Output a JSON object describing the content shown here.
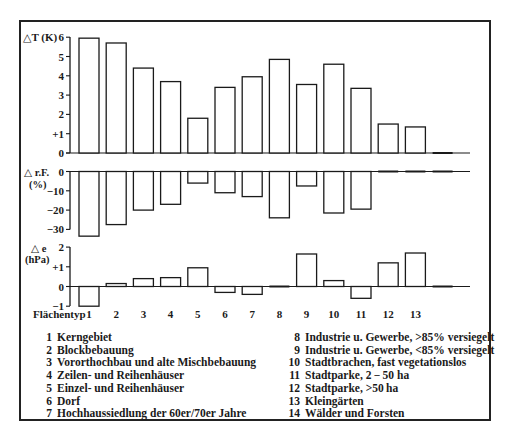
{
  "chart_data": [
    {
      "type": "bar",
      "title": "",
      "ylabel": "△T (K)",
      "xlabel": "Flächentyp",
      "categories": [
        "1",
        "2",
        "3",
        "4",
        "5",
        "6",
        "7",
        "8",
        "9",
        "10",
        "11",
        "12",
        "13",
        "14"
      ],
      "values": [
        5.95,
        5.7,
        4.4,
        3.7,
        1.8,
        3.4,
        3.95,
        4.85,
        3.55,
        4.6,
        3.35,
        1.5,
        1.35,
        0.05
      ],
      "ylim": [
        0,
        6
      ],
      "yticks": [
        "0",
        "+1",
        "2",
        "3",
        "4",
        "5",
        "6"
      ],
      "grid": false
    },
    {
      "type": "bar",
      "title": "",
      "ylabel": "△r.F. (%)",
      "xlabel": "Flächentyp",
      "categories": [
        "1",
        "2",
        "3",
        "4",
        "5",
        "6",
        "7",
        "8",
        "9",
        "10",
        "11",
        "12",
        "13",
        "14"
      ],
      "values": [
        -33.5,
        -27.5,
        -20,
        -17,
        -6,
        -11,
        -13,
        -24,
        -7.5,
        -21.5,
        -19.5,
        -0.5,
        -0.5,
        -0.3
      ],
      "ylim": [
        -35,
        0
      ],
      "yticks": [
        "0",
        "−10",
        "−20",
        "−30"
      ],
      "grid": false
    },
    {
      "type": "bar",
      "title": "",
      "ylabel": "△e (hPa)",
      "xlabel": "Flächentyp",
      "categories": [
        "1",
        "2",
        "3",
        "4",
        "5",
        "6",
        "7",
        "8",
        "9",
        "10",
        "11",
        "12",
        "13",
        "14"
      ],
      "values": [
        -1.0,
        0.15,
        0.4,
        0.45,
        0.95,
        -0.3,
        -0.4,
        0.05,
        1.65,
        0.3,
        -0.6,
        1.2,
        1.7,
        0
      ],
      "ylim": [
        -1,
        2
      ],
      "yticks": [
        "−1",
        "0",
        "+1",
        "2"
      ],
      "grid": false
    }
  ],
  "panels": {
    "dT": {
      "label": "△T (K)",
      "ticks": [
        "6",
        "5",
        "4",
        "3",
        "2",
        "+1",
        "0"
      ]
    },
    "dRF": {
      "label_line1": "△ r.F.",
      "label_line2": "(%)",
      "ticks": [
        "0",
        "−10",
        "−20",
        "−30"
      ]
    },
    "de": {
      "label_line1": "△ e",
      "label_line2": "(hPa)",
      "ticks": [
        "2",
        "+1",
        "0",
        "−1"
      ]
    }
  },
  "x_axis": {
    "label": "Flächentyp",
    "ticks": [
      "1",
      "2",
      "3",
      "4",
      "5",
      "6",
      "7",
      "8",
      "9",
      "10",
      "11",
      "12",
      "13"
    ]
  },
  "legend": {
    "left": [
      {
        "num": "1",
        "text": "Kerngebiet"
      },
      {
        "num": "2",
        "text": "Blockbebauung"
      },
      {
        "num": "3",
        "text": "Vororthochbau und alte Mischbebauung"
      },
      {
        "num": "4",
        "text": "Zeilen- und Reihenhäuser"
      },
      {
        "num": "5",
        "text": "Einzel- und Reihenhäuser"
      },
      {
        "num": "6",
        "text": "Dorf"
      },
      {
        "num": "7",
        "text": "Hochhaussiedlung der  60er/70er Jahre"
      }
    ],
    "right": [
      {
        "num": "8",
        "text": "Industrie u. Gewerbe, >85% versiegelt"
      },
      {
        "num": "9",
        "text": "Industrie u. Gewerbe, <85%  versiegelt"
      },
      {
        "num": "10",
        "text": "Stadtbrachen, fast vegetationslos"
      },
      {
        "num": "11",
        "text": "Stadtparke, 2 − 50 ha"
      },
      {
        "num": "12",
        "text": "Stadtparke, >50 ha"
      },
      {
        "num": "13",
        "text": "Kleingärten"
      },
      {
        "num": "14",
        "text": "Wälder und Forsten"
      }
    ]
  },
  "colors": {
    "ink": "#1a1a1a",
    "bar_fill": "#ffffff",
    "background": "#ffffff"
  }
}
